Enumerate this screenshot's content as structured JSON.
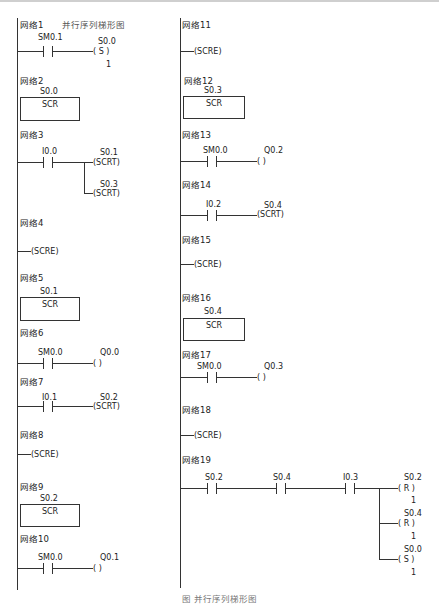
{
  "title": "并行序列梯形图",
  "caption": "图  并行序列梯形图",
  "networks": {
    "n1": {
      "label": "网络1",
      "contact": "SM0.1",
      "coil_addr": "S0.0",
      "coil": "( S )",
      "count": "1"
    },
    "n2": {
      "label": "网络2",
      "addr": "S0.0",
      "box": "SCR"
    },
    "n3": {
      "label": "网络3",
      "contact": "I0.0",
      "coil1_addr": "S0.1",
      "coil1": "(SCRT)",
      "coil2_addr": "S0.3",
      "coil2": "(SCRT)"
    },
    "n4": {
      "label": "网络4",
      "coil": "(SCRE)"
    },
    "n5": {
      "label": "网络5",
      "addr": "S0.1",
      "box": "SCR"
    },
    "n6": {
      "label": "网络6",
      "contact": "SM0.0",
      "coil_addr": "Q0.0",
      "coil": "(      )"
    },
    "n7": {
      "label": "网络7",
      "contact": "I0.1",
      "coil_addr": "S0.2",
      "coil": "(SCRT)"
    },
    "n8": {
      "label": "网络8",
      "coil": "(SCRE)"
    },
    "n9": {
      "label": "网络9",
      "addr": "S0.2",
      "box": "SCR"
    },
    "n10": {
      "label": "网络10",
      "contact": "SM0.0",
      "coil_addr": "Q0.1",
      "coil": "(      )"
    },
    "n11": {
      "label": "网络11",
      "coil": "(SCRE)"
    },
    "n12": {
      "label": "网络12",
      "addr": "S0.3",
      "box": "SCR"
    },
    "n13": {
      "label": "网络13",
      "contact": "SM0.0",
      "coil_addr": "Q0.2",
      "coil": "(      )"
    },
    "n14": {
      "label": "网络14",
      "contact": "I0.2",
      "coil_addr": "S0.4",
      "coil": "(SCRT)"
    },
    "n15": {
      "label": "网络15",
      "coil": "(SCRE)"
    },
    "n16": {
      "label": "网络16",
      "addr": "S0.4",
      "box": "SCR"
    },
    "n17": {
      "label": "网络17",
      "contact": "SM0.0",
      "coil_addr": "Q0.3",
      "coil": "(      )"
    },
    "n18": {
      "label": "网络18",
      "coil": "(SCRE)"
    },
    "n19": {
      "label": "网络19",
      "contacts": [
        "S0.2",
        "S0.4",
        "I0.3"
      ],
      "coils": [
        {
          "addr": "S0.2",
          "coil": "( R )",
          "count": "1"
        },
        {
          "addr": "S0.4",
          "coil": "( R )",
          "count": "1"
        },
        {
          "addr": "S0.0",
          "coil": "( S )",
          "count": "1"
        }
      ]
    }
  }
}
